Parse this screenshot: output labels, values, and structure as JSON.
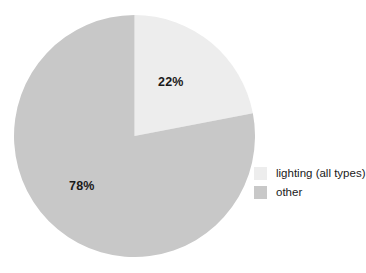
{
  "chart_data": {
    "type": "pie",
    "title": "",
    "xlabel": "",
    "ylabel": "",
    "categories": [
      "lighting (all types)",
      "other"
    ],
    "values": [
      22,
      78
    ],
    "data_labels": [
      "22%",
      "78%"
    ],
    "colors": [
      "#ededed",
      "#c8c8c8"
    ],
    "start_angle_deg": 0,
    "direction": "clockwise",
    "grid": false,
    "legend": {
      "position": "right",
      "entries": [
        {
          "label": "lighting (all types)",
          "color": "#ededed"
        },
        {
          "label": "other",
          "color": "#c8c8c8"
        }
      ]
    },
    "background": "#ffffff"
  },
  "figure": {
    "slice_labels": {
      "lighting": "22%",
      "other": "78%"
    },
    "legend_labels": {
      "lighting": "lighting (all types)",
      "other": "other"
    }
  }
}
